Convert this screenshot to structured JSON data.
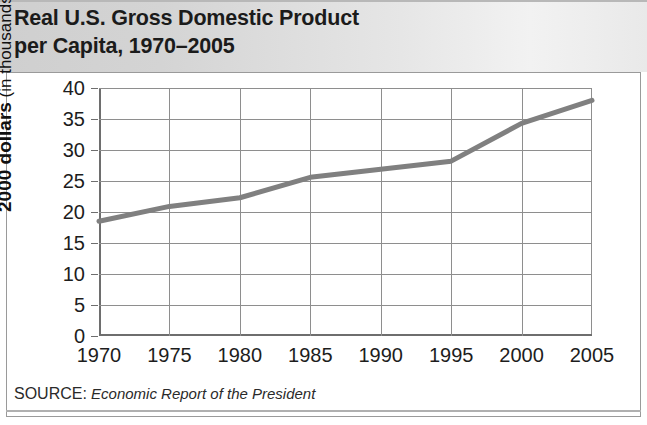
{
  "title": "Real U.S. Gross Domestic Product\nper Capita, 1970–2005",
  "source": {
    "label": "SOURCE:",
    "text": "Economic Report of the President"
  },
  "colors": {
    "line": "#808080",
    "grid": "#8e8e8e",
    "axis": "#6e6e6e",
    "title_band": "#d9d9d9",
    "text": "#1d1d1d",
    "panel_background": "#ffffff"
  },
  "chart_data": {
    "type": "line",
    "title": "Real U.S. Gross Domestic Product per Capita, 1970–2005",
    "xlabel": "",
    "ylabel": "2000 dollars (in thousands)",
    "ylabel_bold_part": "2000 dollars",
    "ylabel_plain_part": " (in thousands)",
    "x": [
      1970,
      1975,
      1980,
      1985,
      1990,
      1995,
      2000,
      2005
    ],
    "values": [
      18.5,
      20.9,
      22.3,
      25.6,
      26.9,
      28.2,
      34.3,
      38.0
    ],
    "series": [
      {
        "name": "Real GDP per capita",
        "values": [
          18.5,
          20.9,
          22.3,
          25.6,
          26.9,
          28.2,
          34.3,
          38.0
        ]
      }
    ],
    "xlim": [
      1970,
      2005
    ],
    "ylim": [
      0,
      40
    ],
    "xticks": [
      1970,
      1975,
      1980,
      1985,
      1990,
      1995,
      2000,
      2005
    ],
    "yticks": [
      0,
      5,
      10,
      15,
      20,
      25,
      30,
      35,
      40
    ],
    "xtick_labels": [
      "1970",
      "1975",
      "1980",
      "1985",
      "1990",
      "1995",
      "2000",
      "2005"
    ],
    "ytick_labels": [
      "0",
      "5",
      "10",
      "15",
      "20",
      "25",
      "30",
      "35",
      "40"
    ],
    "grid": true,
    "legend": false,
    "legend_position": "none",
    "line_width_px": 5,
    "annotations": []
  }
}
